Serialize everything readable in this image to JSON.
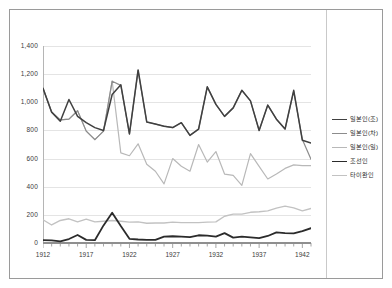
{
  "chart_data": {
    "type": "line",
    "title": "",
    "xlabel": "",
    "ylabel": "",
    "ylim": [
      0,
      1400
    ],
    "ytick_labels": [
      "0",
      "200",
      "400",
      "600",
      "800",
      "1,000",
      "1,200",
      "1,400"
    ],
    "ytick_values": [
      0,
      200,
      400,
      600,
      800,
      1000,
      1200,
      1400
    ],
    "grid": true,
    "grid_axis": "y",
    "legend_position": "right",
    "xlim": [
      1912,
      1943
    ],
    "x": [
      1912,
      1913,
      1914,
      1915,
      1916,
      1917,
      1918,
      1919,
      1920,
      1921,
      1922,
      1923,
      1924,
      1925,
      1926,
      1927,
      1928,
      1929,
      1930,
      1931,
      1932,
      1933,
      1934,
      1935,
      1936,
      1937,
      1938,
      1939,
      1940,
      1941,
      1942,
      1943
    ],
    "xtick_labels": [
      "1912",
      "1917",
      "1922",
      "1927",
      "1932",
      "1937",
      "1942"
    ],
    "xtick_values": [
      1912,
      1917,
      1922,
      1927,
      1932,
      1937,
      1942
    ],
    "series": [
      {
        "name": "일본인(조)",
        "color": "#404040",
        "width": 1.5,
        "values": [
          1100,
          930,
          865,
          1020,
          900,
          855,
          820,
          800,
          1055,
          1125,
          775,
          1230,
          860,
          845,
          830,
          820,
          855,
          765,
          810,
          1110,
          985,
          900,
          960,
          1085,
          1010,
          800,
          980,
          880,
          810,
          1085,
          730,
          710
        ]
      },
      {
        "name": "일본인(차)",
        "color": "#8c8c8c",
        "width": 1.2,
        "values": [
          1100,
          930,
          875,
          880,
          940,
          795,
          735,
          795,
          1150,
          1120,
          775,
          1225,
          860,
          845,
          830,
          820,
          855,
          765,
          810,
          1110,
          985,
          900,
          960,
          1085,
          1010,
          800,
          980,
          880,
          810,
          1080,
          735,
          595
        ]
      },
      {
        "name": "일본인(일)",
        "color": "#b8b8b8",
        "width": 1.2,
        "values": [
          1100,
          930,
          875,
          880,
          940,
          795,
          735,
          795,
          1150,
          640,
          620,
          705,
          560,
          510,
          420,
          600,
          545,
          510,
          700,
          575,
          650,
          490,
          480,
          410,
          635,
          545,
          455,
          490,
          530,
          555,
          550,
          550
        ]
      },
      {
        "name": "조선인",
        "color": "#2b2b2b",
        "width": 1.8,
        "values": [
          20,
          18,
          12,
          28,
          57,
          22,
          20,
          125,
          215,
          120,
          30,
          25,
          22,
          22,
          45,
          48,
          45,
          42,
          55,
          52,
          45,
          70,
          38,
          45,
          40,
          35,
          50,
          75,
          70,
          68,
          85,
          105
        ]
      },
      {
        "name": "타이완인",
        "color": "#c2c2c2",
        "width": 1.4,
        "values": [
          165,
          128,
          160,
          172,
          150,
          170,
          150,
          155,
          160,
          155,
          148,
          150,
          140,
          142,
          142,
          148,
          145,
          145,
          145,
          148,
          150,
          190,
          205,
          205,
          218,
          222,
          228,
          248,
          262,
          250,
          228,
          245
        ]
      }
    ]
  },
  "legend": {
    "entries": [
      {
        "label": "일본인(조)"
      },
      {
        "label": "일본인(차)"
      },
      {
        "label": "일본인(일)"
      },
      {
        "label": "조선인"
      },
      {
        "label": "타이완인"
      }
    ]
  }
}
